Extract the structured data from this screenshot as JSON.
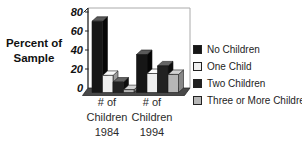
{
  "chart_data": {
    "type": "bar",
    "style": "3d-column-grayscale",
    "title": "",
    "ylabel": "Percent of Sample",
    "xlabel": "",
    "ylim": [
      0,
      80
    ],
    "yticks": [
      "80",
      "60",
      "40",
      "20",
      "0"
    ],
    "ytick_values": [
      80,
      60,
      40,
      20,
      0
    ],
    "grid": false,
    "legend_position": "right",
    "categories": [
      {
        "label": "# of Children 1984",
        "lines": [
          "# of",
          "Children",
          "1984"
        ]
      },
      {
        "label": "# of Children 1994",
        "lines": [
          "# of",
          "Children",
          "1994"
        ]
      }
    ],
    "series": [
      {
        "name": "No Children",
        "values": [
          75,
          40
        ],
        "color": "#161616",
        "color_top": "#5a5a5a",
        "color_side": "#060606"
      },
      {
        "name": "One Child",
        "values": [
          18,
          20
        ],
        "color": "#eeeeee",
        "color_top": "#fbfbfb",
        "color_side": "#9c9c9c"
      },
      {
        "name": "Two Children",
        "values": [
          11,
          28
        ],
        "color": "#212121",
        "color_top": "#646464",
        "color_side": "#0d0d0d"
      },
      {
        "name": "Three or More Children",
        "values": [
          3,
          19
        ],
        "color": "#b6b6b6",
        "color_top": "#d3d3d3",
        "color_side": "#878787"
      }
    ],
    "axis_color": "#222222",
    "wall_outline_color": "#aaaaaa",
    "floor_color": "#484848"
  }
}
